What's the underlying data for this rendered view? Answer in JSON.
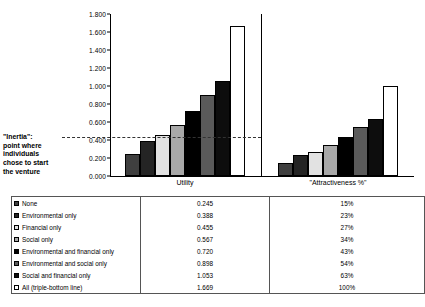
{
  "chart_data": {
    "type": "bar",
    "title": "",
    "xlabel": "",
    "ylabel": "",
    "ylim": [
      0.0,
      1.8
    ],
    "ytick_step": 0.2,
    "ytick_labels": [
      "0.000",
      "0.200",
      "0.400",
      "0.600",
      "0.800",
      "1.000",
      "1.200",
      "1.400",
      "1.600",
      "1.800"
    ],
    "grid": false,
    "legend_position": "table-below",
    "categories": [
      "Utility",
      "\"Attractiveness %\""
    ],
    "series": [
      {
        "name": "None",
        "color": "#3f3f3f",
        "values": [
          0.245,
          0.15
        ]
      },
      {
        "name": "Environmental only",
        "color": "#242424",
        "values": [
          0.388,
          0.23
        ]
      },
      {
        "name": "Financial only",
        "color": "#e2e2e2",
        "values": [
          0.455,
          0.27
        ]
      },
      {
        "name": "Social only",
        "color": "#a8a8a8",
        "values": [
          0.567,
          0.34
        ]
      },
      {
        "name": "Environmental and financial only",
        "color": "#000000",
        "values": [
          0.72,
          0.43
        ]
      },
      {
        "name": "Environmental and social only",
        "color": "#5a5a5a",
        "values": [
          0.898,
          0.54
        ]
      },
      {
        "name": "Social and financial only",
        "color": "#0d0d0d",
        "values": [
          1.053,
          0.63
        ]
      },
      {
        "name": "All (triple-bottom line)",
        "color": "#ffffff",
        "values": [
          1.669,
          1.0
        ]
      }
    ],
    "annotation": {
      "label": "\"Inertia\":\npoint where\nindividuals\nchose to start\nthe venture",
      "line_value": 0.43
    }
  },
  "annotation": {
    "line1": "\"Inertia\":",
    "line2": "point where",
    "line3": "individuals",
    "line4": "chose to start",
    "line5": "the venture"
  },
  "axis": {
    "ticks": [
      "1.800",
      "1.600",
      "1.400",
      "1.200",
      "1.000",
      "0.800",
      "0.600",
      "0.400",
      "0.200",
      "0.000"
    ]
  },
  "categories": {
    "utility": "Utility",
    "attractiveness": "\"Attractiveness %\""
  },
  "table": {
    "rows": [
      {
        "label": "None",
        "utility": "0.245",
        "attractiveness": "15%",
        "color": "#3f3f3f"
      },
      {
        "label": "Environmental only",
        "utility": "0.388",
        "attractiveness": "23%",
        "color": "#242424"
      },
      {
        "label": "Financial only",
        "utility": "0.455",
        "attractiveness": "27%",
        "color": "#e2e2e2"
      },
      {
        "label": "Social only",
        "utility": "0.567",
        "attractiveness": "34%",
        "color": "#a8a8a8"
      },
      {
        "label": "Environmental and financial only",
        "utility": "0.720",
        "attractiveness": "43%",
        "color": "#000000"
      },
      {
        "label": "Environmental and social only",
        "utility": "0.898",
        "attractiveness": "54%",
        "color": "#5a5a5a"
      },
      {
        "label": "Social and financial only",
        "utility": "1.053",
        "attractiveness": "63%",
        "color": "#0d0d0d"
      },
      {
        "label": "All (triple-bottom line)",
        "utility": "1.669",
        "attractiveness": "100%",
        "color": "#ffffff"
      }
    ]
  }
}
